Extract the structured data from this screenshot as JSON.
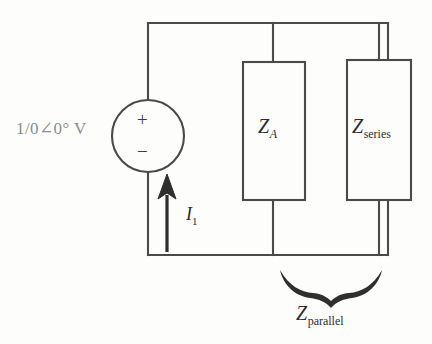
{
  "figure": {
    "type": "electrical-circuit-schematic",
    "line_color": "#4a4a4a",
    "ink_color": "#2e2e2e",
    "faded_ink_color": "#8d8d8d",
    "background": "#fdfdfc"
  },
  "source": {
    "label": "1/0∠0° V",
    "magnitude_text": "1/0",
    "angle_symbol": "∠",
    "angle_text": "0",
    "degree_symbol": "°",
    "unit": "V",
    "polarity_plus": "+",
    "polarity_minus": "−",
    "symbol": "voltage-source-circle"
  },
  "current": {
    "label": "I",
    "subscript": "1",
    "direction": "upward",
    "arrow_symbol": "up-arrow"
  },
  "components": [
    {
      "id": "za",
      "label": "Z",
      "subscript": "A",
      "subscript_style": "italic",
      "shape": "rectangle",
      "branch": "middle"
    },
    {
      "id": "zseries",
      "label": "Z",
      "subscript": "series",
      "subscript_style": "upright",
      "shape": "rectangle",
      "branch": "right"
    }
  ],
  "annotation": {
    "brace": "curly-brace-down",
    "label": "Z",
    "subscript": "parallel",
    "subscript_style": "upright",
    "spans": [
      "za",
      "zseries"
    ]
  }
}
